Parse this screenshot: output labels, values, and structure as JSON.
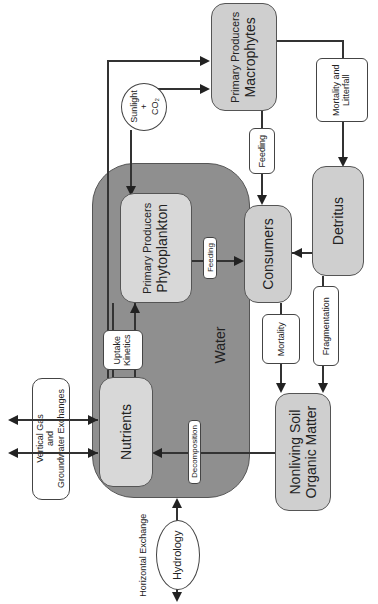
{
  "diagram": {
    "orientation": "rotated 90° counter-clockwise",
    "container": {
      "label": "Water"
    },
    "nodes": {
      "macrophytes": {
        "title": "Primary Producers",
        "name": "Macrophytes"
      },
      "phytoplankton": {
        "title": "Primary Producers",
        "name": "Phytoplankton"
      },
      "consumers": {
        "name": "Consumers"
      },
      "detritus": {
        "name": "Detritus"
      },
      "nutrients": {
        "name": "Nutrients"
      },
      "nsom": {
        "line1": "Nonliving Soil",
        "line2": "Organic Matter"
      },
      "sunlight": {
        "line1": "Sunlight",
        "line2": "+",
        "line3": "CO₂"
      },
      "hydrology": {
        "name": "Hydrology"
      },
      "exchanges": {
        "line1": "Vertical Gas",
        "line2": "and",
        "line3": "Groundwater Exchanges"
      }
    },
    "process_labels": {
      "feeding_macro": "Feeding",
      "feeding_phyto": "Feeding",
      "mortality_litterfall_1": "Mortality and",
      "mortality_litterfall_2": "Litterfall",
      "mortality": "Mortality",
      "fragmentation": "Fragmentation",
      "uptake_1": "Uptake",
      "uptake_2": "Kinetics",
      "decomposition": "Decomposition",
      "horizontal_exchange": "Horizontal Exchange"
    },
    "edges": [
      {
        "from": "Sunlight + CO2",
        "to": "Macrophytes"
      },
      {
        "from": "Sunlight + CO2",
        "to": "Phytoplankton"
      },
      {
        "from": "Nutrients",
        "to": "Macrophytes"
      },
      {
        "from": "Nutrients",
        "to": "Phytoplankton",
        "label": "Uptake Kinetics"
      },
      {
        "from": "Macrophytes",
        "to": "Consumers",
        "label": "Feeding"
      },
      {
        "from": "Macrophytes",
        "to": "Detritus",
        "label": "Mortality and Litterfall"
      },
      {
        "from": "Phytoplankton",
        "to": "Consumers",
        "label": "Feeding"
      },
      {
        "from": "Detritus",
        "to": "Consumers"
      },
      {
        "from": "Consumers",
        "to": "Nonliving Soil Organic Matter",
        "label": "Mortality"
      },
      {
        "from": "Detritus",
        "to": "Nonliving Soil Organic Matter",
        "label": "Fragmentation"
      },
      {
        "from": "Nonliving Soil Organic Matter",
        "to": "Nutrients",
        "label": "Decomposition"
      },
      {
        "from": "Vertical Gas and Groundwater Exchanges",
        "to": "Nutrients",
        "bidirectional": true
      },
      {
        "from": "Hydrology",
        "to": "Water",
        "label": "Horizontal Exchange",
        "bidirectional": true
      }
    ]
  }
}
